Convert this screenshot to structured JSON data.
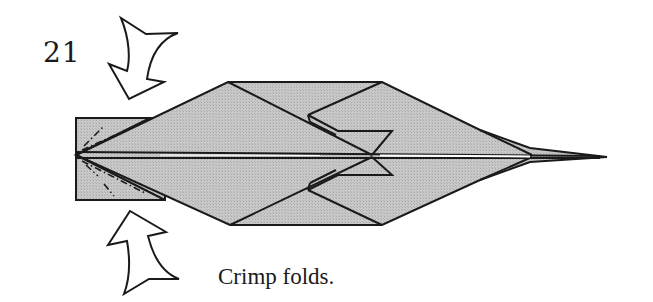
{
  "step": {
    "number": "21"
  },
  "caption": {
    "text": "Crimp folds."
  },
  "colors": {
    "paper": "#c4c4c4",
    "line": "#1a1a1a",
    "background": "#ffffff",
    "arrow_fill": "#ffffff"
  },
  "diagram": {
    "arrows": [
      {
        "name": "push-arrow-top",
        "direction": "down",
        "meaning": "push in (crimp)"
      },
      {
        "name": "push-arrow-bottom",
        "direction": "up",
        "meaning": "push in (crimp)"
      }
    ],
    "fold_lines": "dash-dot mountain fold lines on left flap"
  }
}
